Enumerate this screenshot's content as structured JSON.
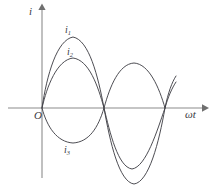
{
  "figure": {
    "kind": "waveform-diagram",
    "background_color": "#ffffff",
    "axis_color": "#8c8c8c",
    "curve_color": "#43434a",
    "label_color": "#3a3a3f",
    "width": 211,
    "height": 185
  },
  "axes": {
    "vertical": {
      "label": "i",
      "name": "current-axis",
      "origin_x": 42,
      "top_y": 5,
      "bottom_y": 178
    },
    "horizontal": {
      "label": "ωt",
      "name": "omega-t-axis",
      "origin_y": 108,
      "left_x": 8,
      "right_x": 205
    },
    "origin_label": "O"
  },
  "chart_data": {
    "type": "line",
    "title": "",
    "xlabel": "ωt",
    "ylabel": "i",
    "grid": false,
    "legend": "inline-curve-labels",
    "origin_label": "O",
    "axis_origin_px": [
      42,
      108
    ],
    "zero_crossings_px": [
      42,
      104,
      165
    ],
    "series": [
      {
        "name": "i1",
        "label": "i₁",
        "label_text": "i",
        "label_sub": "1",
        "description": "largest-amplitude sinusoid, positive first half-cycle peak highest, negative second half-cycle deepest (clipped at frame bottom)",
        "amplitude_px": 71,
        "peak_positive_px": [
          73,
          37
        ],
        "peak_negative_px": [
          134,
          182
        ],
        "path": "M 42 108 C 47 74, 57 40, 73 37 C 89 40, 98 76, 104 108 C 110 142, 119 182, 134 184 C 149 182, 159 142, 165 108 C 168 93, 172 82, 176 76"
      },
      {
        "name": "i2",
        "label": "i₂",
        "label_text": "i",
        "label_sub": "2",
        "description": "medium-amplitude sinusoid, in phase with i1, smaller positive peak and shallower negative trough",
        "amplitude_px": 50,
        "peak_positive_px": [
          73,
          58
        ],
        "peak_negative_px": [
          132,
          168
        ],
        "path": "M 42 108 C 47 86, 57 60, 73 58 C 89 60, 98 86, 104 108 C 110 133, 118 167, 132 169 C 146 167, 157 131, 165 108 C 168 97, 172 88, 176 82"
      },
      {
        "name": "i3",
        "label": "i₃",
        "label_text": "i",
        "label_sub": "3",
        "description": "inverted sinusoid, 180 degrees out of phase: negative first half-cycle trough then positive second half-cycle crest",
        "amplitude_px": 50,
        "trough_negative_px": [
          73,
          143
        ],
        "peak_positive_px": [
          134,
          64
        ],
        "path": "M 42 108 C 47 127, 57 142, 73 143 C 89 142, 98 128, 104 108 C 110 86, 119 64, 134 63 C 149 64, 159 87, 165 108"
      }
    ]
  },
  "labels": {
    "i_axis": "i",
    "omega_t": "ωt",
    "origin": "O",
    "i1_base": "i",
    "i1_sub": "1",
    "i2_base": "i",
    "i2_sub": "2",
    "i3_base": "i",
    "i3_sub": "3"
  }
}
